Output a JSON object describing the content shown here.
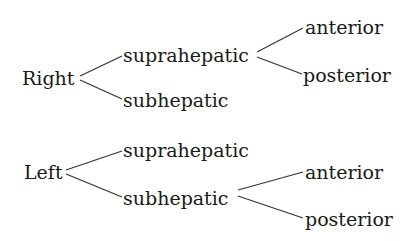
{
  "tree": {
    "right": {
      "label": "Right",
      "suprahepatic": {
        "label": "suprahepatic",
        "anterior": "anterior",
        "posterior": "posterior"
      },
      "subhepatic": {
        "label": "subhepatic"
      }
    },
    "left": {
      "label": "Left",
      "suprahepatic": {
        "label": "suprahepatic"
      },
      "subhepatic": {
        "label": "subhepatic",
        "anterior": "anterior",
        "posterior": "posterior"
      }
    }
  },
  "colors": {
    "text": "#1a1a1a",
    "lines": "#333333",
    "background": "#ffffff"
  }
}
